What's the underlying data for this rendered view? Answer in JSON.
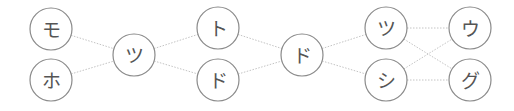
{
  "diagram": {
    "type": "layered-graph",
    "colors": {
      "node_stroke": "#8a8a8a",
      "edge": "#c4c4c4",
      "label": "#555555",
      "background": "#ffffff"
    },
    "node_radius": 21,
    "nodes": [
      {
        "id": "n0",
        "label": "モ",
        "x": 51,
        "y": 29
      },
      {
        "id": "n1",
        "label": "ホ",
        "x": 51,
        "y": 80
      },
      {
        "id": "n2",
        "label": "ツ",
        "x": 134,
        "y": 55
      },
      {
        "id": "n3",
        "label": "ト",
        "x": 218,
        "y": 28
      },
      {
        "id": "n4",
        "label": "ド",
        "x": 218,
        "y": 80
      },
      {
        "id": "n5",
        "label": "ド",
        "x": 302,
        "y": 55
      },
      {
        "id": "n6",
        "label": "ツ",
        "x": 386,
        "y": 28
      },
      {
        "id": "n7",
        "label": "シ",
        "x": 386,
        "y": 80
      },
      {
        "id": "n8",
        "label": "ウ",
        "x": 470,
        "y": 28
      },
      {
        "id": "n9",
        "label": "グ",
        "x": 470,
        "y": 80
      }
    ],
    "edges": [
      [
        "n0",
        "n2"
      ],
      [
        "n1",
        "n2"
      ],
      [
        "n2",
        "n3"
      ],
      [
        "n2",
        "n4"
      ],
      [
        "n3",
        "n5"
      ],
      [
        "n4",
        "n5"
      ],
      [
        "n5",
        "n6"
      ],
      [
        "n5",
        "n7"
      ],
      [
        "n6",
        "n8"
      ],
      [
        "n6",
        "n9"
      ],
      [
        "n7",
        "n8"
      ],
      [
        "n7",
        "n9"
      ]
    ]
  }
}
